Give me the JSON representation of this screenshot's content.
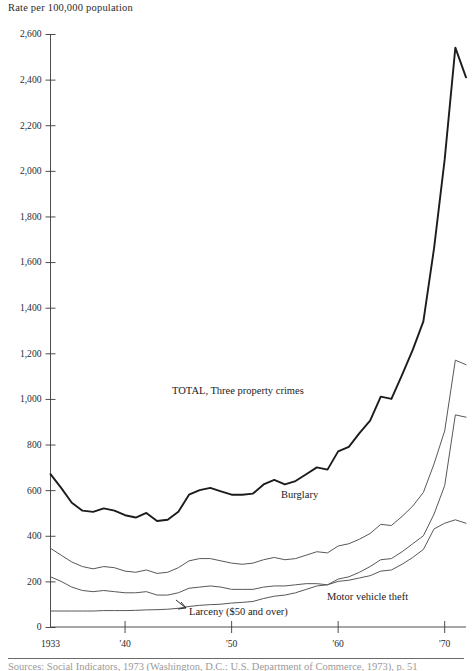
{
  "figure": {
    "axis_title": "Rate per 100,000 population",
    "footnote": "Sources: Social Indicators, 1973 (Washington, D.C.: U.S. Department of Commerce, 1973), p. 51"
  },
  "chart_data": {
    "type": "line",
    "title": "Rate per 100,000 population",
    "xlabel": "",
    "ylabel": "Rate per 100,000 population",
    "xlim": [
      1933,
      1972
    ],
    "ylim": [
      0,
      2600
    ],
    "ytick_labels": [
      "2,600",
      "2,400",
      "2,200",
      "2,000",
      "1,800",
      "1,600",
      "1,400",
      "1,200",
      "1,000",
      "800",
      "600",
      "400",
      "200",
      "0"
    ],
    "ytick_values": [
      2600,
      2400,
      2200,
      2000,
      1800,
      1600,
      1400,
      1200,
      1000,
      800,
      600,
      400,
      200,
      0
    ],
    "xtick_labels": [
      "1933",
      "'40",
      "'50",
      "'60",
      "'70"
    ],
    "xtick_values": [
      1933,
      1940,
      1950,
      1960,
      1970
    ],
    "grid": false,
    "legend_position": "inline-annotations",
    "x": [
      1933,
      1934,
      1935,
      1936,
      1937,
      1938,
      1939,
      1940,
      1941,
      1942,
      1943,
      1944,
      1945,
      1946,
      1947,
      1948,
      1949,
      1950,
      1951,
      1952,
      1953,
      1954,
      1955,
      1956,
      1957,
      1958,
      1959,
      1960,
      1961,
      1962,
      1963,
      1964,
      1965,
      1966,
      1967,
      1968,
      1969,
      1970,
      1971,
      1972
    ],
    "series": [
      {
        "name": "TOTAL, Three property crimes",
        "label": "TOTAL, Three property crimes",
        "values": [
          670,
          610,
          545,
          510,
          505,
          520,
          510,
          490,
          480,
          500,
          465,
          470,
          505,
          580,
          600,
          610,
          595,
          580,
          580,
          585,
          625,
          645,
          625,
          640,
          670,
          700,
          690,
          770,
          790,
          850,
          905,
          1010,
          1000,
          1105,
          1215,
          1340,
          1660,
          2050,
          2540,
          2410
        ]
      },
      {
        "name": "Burglary",
        "label": "Burglary",
        "values": [
          345,
          315,
          285,
          265,
          255,
          265,
          260,
          245,
          240,
          250,
          235,
          240,
          260,
          290,
          300,
          300,
          290,
          280,
          275,
          280,
          295,
          305,
          295,
          300,
          315,
          330,
          325,
          355,
          365,
          385,
          410,
          450,
          445,
          485,
          530,
          590,
          715,
          860,
          1170,
          1150
        ]
      },
      {
        "name": "Larceny ($50 and over)",
        "label": "Larceny ($50 and over)",
        "values": [
          70,
          70,
          70,
          70,
          70,
          72,
          72,
          72,
          73,
          75,
          76,
          78,
          82,
          90,
          95,
          98,
          100,
          105,
          108,
          112,
          125,
          135,
          140,
          150,
          165,
          180,
          185,
          210,
          220,
          240,
          265,
          295,
          300,
          330,
          365,
          400,
          495,
          620,
          930,
          920
        ]
      },
      {
        "name": "Motor vehicle theft",
        "label": "Motor vehicle theft",
        "values": [
          220,
          200,
          175,
          160,
          155,
          160,
          155,
          150,
          150,
          155,
          140,
          140,
          150,
          170,
          175,
          180,
          175,
          165,
          165,
          165,
          175,
          180,
          180,
          185,
          190,
          190,
          185,
          200,
          205,
          215,
          225,
          245,
          250,
          275,
          305,
          340,
          430,
          455,
          470,
          455
        ]
      }
    ],
    "annotations": [
      {
        "text": "TOTAL, Three property crimes",
        "x": 1950,
        "y": 1000
      },
      {
        "text": "Burglary",
        "x": 1957,
        "y": 560
      },
      {
        "text": "Motor vehicle theft",
        "x": 1964,
        "y": 245
      },
      {
        "text": "Larceny ($50 and over)",
        "x": 1943,
        "y": 95
      }
    ]
  }
}
